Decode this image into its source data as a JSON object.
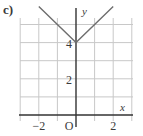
{
  "panel_label": "c)",
  "colors": {
    "grid": "#c8c8c8",
    "axis": "#333333",
    "curve": "#6e6e6e",
    "text": "#3a3a3a"
  },
  "chart_data": {
    "type": "line",
    "title": "",
    "function": "y = |x| + 4",
    "xlabel": "x",
    "ylabel": "y",
    "xlim": [
      -3,
      3
    ],
    "ylim": [
      0,
      6
    ],
    "grid": true,
    "grid_step": 1,
    "x_ticks": [
      {
        "value": -2,
        "label": "−2"
      },
      {
        "value": 0,
        "label": "O"
      },
      {
        "value": 2,
        "label": "2"
      }
    ],
    "y_ticks": [
      {
        "value": 2,
        "label": "2"
      },
      {
        "value": 4,
        "label": "4"
      }
    ],
    "series": [
      {
        "name": "y = |x| + 4",
        "x": [
          -2,
          0,
          2
        ],
        "y": [
          6,
          4,
          6
        ]
      }
    ]
  }
}
